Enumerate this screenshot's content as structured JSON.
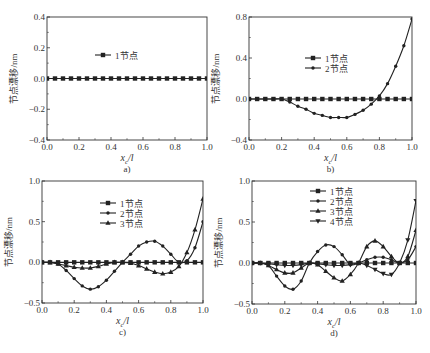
{
  "figure": {
    "panels_label": [
      "a)",
      "b)",
      "c)",
      "d)"
    ]
  },
  "chart_data": [
    {
      "id": "a",
      "type": "line",
      "subtitle": "a)",
      "xlabel": "x_c/l",
      "ylabel": "节点漂移/nm",
      "xlim": [
        0.0,
        1.0
      ],
      "ylim": [
        -0.4,
        0.4
      ],
      "xticks": [
        "0.0",
        "0.2",
        "0.4",
        "0.6",
        "0.8",
        "1.0"
      ],
      "yticks": [
        "-0.4",
        "-0.2",
        "0.0",
        "0.2",
        "0.4"
      ],
      "ytick_values": [
        -0.4,
        -0.2,
        0.0,
        0.2,
        0.4
      ],
      "grid": false,
      "legend_position": "upper-center",
      "frame": {
        "left": 47,
        "top": 17,
        "right": 207,
        "bottom": 140
      },
      "legend": {
        "x": 95,
        "y": 55
      },
      "x": [
        0.0,
        0.05,
        0.1,
        0.15,
        0.2,
        0.25,
        0.3,
        0.35,
        0.4,
        0.45,
        0.5,
        0.55,
        0.6,
        0.65,
        0.7,
        0.75,
        0.8,
        0.85,
        0.9,
        0.95,
        1.0
      ],
      "series": [
        {
          "name": "1节点",
          "marker": "square",
          "values": [
            0,
            0,
            0,
            0,
            0,
            0,
            0,
            0,
            0,
            0,
            0,
            0,
            0,
            0,
            0,
            0,
            0,
            0,
            0,
            0,
            0
          ]
        }
      ]
    },
    {
      "id": "b",
      "type": "line",
      "subtitle": "b)",
      "xlabel": "x_c/l",
      "ylabel": "节点漂移/nm",
      "xlim": [
        0.0,
        1.0
      ],
      "ylim": [
        -0.4,
        0.8
      ],
      "xticks": [
        "0.0",
        "0.2",
        "0.4",
        "0.6",
        "0.8",
        "1.0"
      ],
      "yticks": [
        "-0.4",
        "0.0",
        "0.4",
        "0.8"
      ],
      "ytick_values": [
        -0.4,
        0.0,
        0.4,
        0.8
      ],
      "grid": false,
      "legend_position": "upper-center",
      "frame": {
        "left": 249,
        "top": 17,
        "right": 412,
        "bottom": 140
      },
      "legend": {
        "x": 305,
        "y": 58
      },
      "x": [
        0.0,
        0.05,
        0.1,
        0.15,
        0.2,
        0.25,
        0.3,
        0.35,
        0.4,
        0.45,
        0.5,
        0.55,
        0.6,
        0.65,
        0.7,
        0.75,
        0.8,
        0.85,
        0.9,
        0.95,
        1.0
      ],
      "series": [
        {
          "name": "1节点",
          "marker": "square",
          "values": [
            0,
            0,
            0,
            0,
            0,
            0,
            0,
            0,
            0,
            0,
            0,
            0,
            0,
            0,
            0,
            0,
            0,
            0,
            0,
            0,
            0
          ]
        },
        {
          "name": "2节点",
          "marker": "dot",
          "values": [
            0,
            0,
            0,
            0,
            0,
            -0.03,
            -0.07,
            -0.1,
            -0.14,
            -0.16,
            -0.18,
            -0.18,
            -0.18,
            -0.15,
            -0.11,
            -0.05,
            0.03,
            0.15,
            0.32,
            0.52,
            0.78
          ]
        }
      ]
    },
    {
      "id": "c",
      "type": "line",
      "subtitle": "c)",
      "xlabel": "x_c/l",
      "ylabel": "节点漂移/nm",
      "xlim": [
        0.0,
        1.0
      ],
      "ylim": [
        -0.5,
        1.0
      ],
      "xticks": [
        "0.0",
        "0.2",
        "0.4",
        "0.6",
        "0.8",
        "1.0"
      ],
      "yticks": [
        "-0.5",
        "0.0",
        "0.5",
        "1.0"
      ],
      "ytick_values": [
        -0.5,
        0.0,
        0.5,
        1.0
      ],
      "grid": false,
      "legend_position": "upper-center",
      "frame": {
        "left": 42,
        "top": 181,
        "right": 203,
        "bottom": 303
      },
      "legend": {
        "x": 100,
        "y": 203
      },
      "x": [
        0.0,
        0.05,
        0.1,
        0.15,
        0.2,
        0.25,
        0.3,
        0.35,
        0.4,
        0.45,
        0.5,
        0.55,
        0.6,
        0.65,
        0.7,
        0.75,
        0.8,
        0.85,
        0.9,
        0.95,
        1.0
      ],
      "series": [
        {
          "name": "1节点",
          "marker": "square",
          "values": [
            0,
            0,
            0,
            0,
            0,
            0,
            0,
            0,
            0,
            0,
            0,
            0,
            0,
            0,
            0,
            0,
            0,
            0,
            0,
            0,
            0
          ]
        },
        {
          "name": "2节点",
          "marker": "dot",
          "values": [
            0,
            0,
            -0.02,
            -0.1,
            -0.2,
            -0.29,
            -0.33,
            -0.3,
            -0.22,
            -0.11,
            0,
            0.1,
            0.2,
            0.25,
            0.26,
            0.2,
            0.1,
            0,
            0.02,
            0.18,
            0.5
          ]
        },
        {
          "name": "3节点",
          "marker": "triangle-up",
          "values": [
            0,
            0,
            -0.02,
            -0.04,
            -0.06,
            -0.07,
            -0.07,
            -0.05,
            -0.02,
            0,
            0,
            -0.01,
            -0.04,
            -0.08,
            -0.12,
            -0.14,
            -0.12,
            -0.05,
            0.12,
            0.4,
            0.78
          ]
        }
      ]
    },
    {
      "id": "d",
      "type": "line",
      "subtitle": "d)",
      "xlabel": "x_c/l",
      "ylabel": "节点漂移/nm",
      "xlim": [
        0.0,
        1.0
      ],
      "ylim": [
        -0.5,
        1.0
      ],
      "xticks": [
        "0.0",
        "0.2",
        "0.4",
        "0.6",
        "0.8",
        "1.0"
      ],
      "yticks": [
        "-0.5",
        "0.0",
        "0.5",
        "1.0"
      ],
      "ytick_values": [
        -0.5,
        0.0,
        0.5,
        1.0
      ],
      "grid": false,
      "legend_position": "upper-center",
      "frame": {
        "left": 252,
        "top": 181,
        "right": 416,
        "bottom": 304
      },
      "legend": {
        "x": 310,
        "y": 191
      },
      "x": [
        0.0,
        0.05,
        0.1,
        0.15,
        0.2,
        0.25,
        0.3,
        0.35,
        0.4,
        0.45,
        0.5,
        0.55,
        0.6,
        0.65,
        0.7,
        0.75,
        0.8,
        0.85,
        0.9,
        0.95,
        1.0
      ],
      "series": [
        {
          "name": "1节点",
          "marker": "square",
          "values": [
            0,
            0,
            0,
            0,
            0,
            0,
            0,
            0,
            0,
            0,
            0,
            0,
            0,
            0,
            0,
            0,
            0,
            0,
            0,
            0,
            0
          ]
        },
        {
          "name": "2节点",
          "marker": "dot",
          "values": [
            0,
            0,
            -0.03,
            -0.16,
            -0.28,
            -0.32,
            -0.22,
            0,
            0.14,
            0.22,
            0.2,
            0.1,
            -0.02,
            0,
            0.04,
            0.07,
            0.07,
            0.04,
            0,
            0.04,
            0.2
          ]
        },
        {
          "name": "3节点",
          "marker": "triangle-up",
          "values": [
            0,
            0,
            -0.03,
            -0.08,
            -0.12,
            -0.12,
            -0.06,
            0,
            -0.02,
            -0.1,
            -0.18,
            -0.22,
            -0.14,
            0,
            0.2,
            0.27,
            0.2,
            0.08,
            0,
            0.08,
            0.4
          ]
        },
        {
          "name": "4节点",
          "marker": "triangle-down",
          "values": [
            0,
            0,
            -0.01,
            -0.02,
            -0.03,
            -0.03,
            -0.02,
            0,
            -0.01,
            -0.02,
            -0.03,
            -0.03,
            -0.02,
            0,
            -0.03,
            -0.08,
            -0.13,
            -0.14,
            0,
            0.28,
            0.76
          ]
        }
      ]
    }
  ]
}
